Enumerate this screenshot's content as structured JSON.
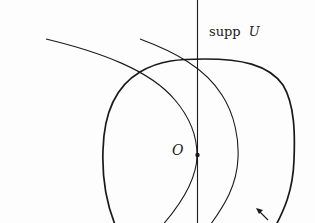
{
  "diagram": {
    "labels": {
      "support": "supp",
      "support_var": "U",
      "origin": "O"
    },
    "elements": [
      {
        "id": "vertical-axis",
        "type": "line",
        "description": "vertical line through O"
      },
      {
        "id": "closed-region-boundary",
        "type": "closed-curve",
        "description": "rounded closed curve enclosing O"
      },
      {
        "id": "level-curve-1",
        "type": "curve",
        "description": "curve tangent to vertical line at O"
      },
      {
        "id": "level-curve-2",
        "type": "curve",
        "description": "curve to the right of the first"
      },
      {
        "id": "origin-point",
        "type": "point",
        "label": "O"
      },
      {
        "id": "arrow",
        "type": "arrow",
        "description": "small arrow near lower right pointing up-left"
      }
    ],
    "colors": {
      "stroke": "#1a1a1a",
      "background": "#fdfdfd"
    }
  }
}
